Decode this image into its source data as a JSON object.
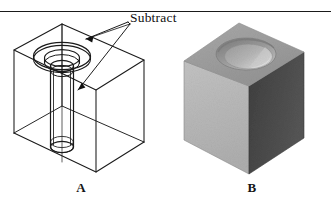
{
  "figure": {
    "caption_a": "A",
    "caption_b": "B",
    "annotation_label": "Subtract",
    "colors": {
      "line": "#1a1a1a",
      "rule": "#1a1a1a",
      "text": "#101010",
      "cube_top_face": "#9e9e9e",
      "cube_left_face": "#b9b9b9",
      "cube_right_face": "#4a4a4a",
      "recess_wall": "#8a8a8a",
      "recess_highlight": "#d8d8d8",
      "recess_floor": "#adadad",
      "background": "#ffffff"
    }
  },
  "diagram_a": {
    "name": "wireframe-box-with-counterbored-hole",
    "description": "Transparent wireframe rectangular box containing a counterbore cylinder at the top face and a narrower cylinder passing entirely through to the bottom face.",
    "elements": [
      "box-wireframe",
      "counterbore-outer-ellipse",
      "counterbore-inner-ellipse",
      "through-hole-cylinder",
      "through-hole-bottom-ellipse"
    ]
  },
  "diagram_b": {
    "name": "shaded-solid-result",
    "description": "Shaded solid cube after the subtract operation, showing a circular counterbore recess in the top face.",
    "elements": [
      "cube-top-face",
      "cube-left-face",
      "cube-right-face",
      "counterbore-recess"
    ]
  },
  "annotations": {
    "leader_targets": [
      "counterbore-ellipse",
      "through-hole-shaft"
    ]
  }
}
